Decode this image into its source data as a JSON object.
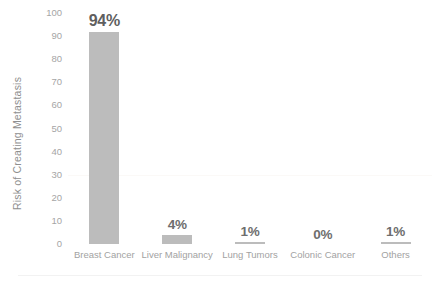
{
  "chart_data": {
    "type": "bar",
    "title": "",
    "xlabel": "",
    "ylabel": "Risk of Creating Metastasis",
    "categories": [
      "Breast Cancer",
      "Liver Malignancy",
      "Lung Tumors",
      "Colonic Cancer",
      "Others"
    ],
    "values": [
      94,
      4,
      1,
      0,
      1
    ],
    "value_labels": [
      "94%",
      "4%",
      "1%",
      "0%",
      "1%"
    ],
    "ylim": [
      0,
      100
    ],
    "y_ticks": [
      0,
      10,
      20,
      30,
      40,
      50,
      60,
      70,
      80,
      90,
      100
    ],
    "y_tick_labels": [
      "0",
      "10",
      "20",
      "30",
      "40",
      "50",
      "60",
      "70",
      "80",
      "90",
      "100"
    ],
    "grid": true,
    "legend": false,
    "bar_color": "#bcbcbc",
    "value_label_color": "#6e6e6e",
    "axis_text_color": "#a2a2a2"
  }
}
